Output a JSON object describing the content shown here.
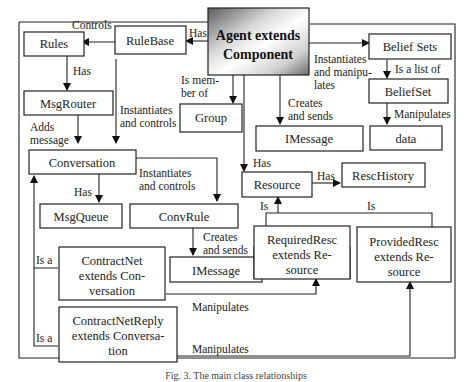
{
  "diagram": {
    "nodes": {
      "agent": {
        "line1": "Agent extends",
        "line2": "Component"
      },
      "rulebase": "RuleBase",
      "rules": "Rules",
      "msgrouter": "MsgRouter",
      "group": "Group",
      "beliefsets": "Belief  Sets",
      "beliefset": "BeliefSet",
      "data": "data",
      "imessage1": "IMessage",
      "conversation": "Conversation",
      "msgqueue": "MsgQueue",
      "convrule": "ConvRule",
      "imessage2": "IMessage",
      "resource": "Resource",
      "reschistory": "RescHistory",
      "requiredresc": {
        "line1": "RequiredResc",
        "line2": "extends Re-",
        "line3": "source"
      },
      "providedresc": {
        "line1": "ProvidedResc",
        "line2": "extends Re-",
        "line3": "source"
      },
      "contractnet": {
        "line1": "ContractNet",
        "line2": "extends Con-",
        "line3": "versation"
      },
      "contractnetreply": {
        "line1": "ContractNetReply",
        "line2": "extends Conversa-",
        "line3": "tion"
      }
    },
    "edges": {
      "agent_rulebase": "Has",
      "rulebase_rules": "Controls",
      "rules_msgrouter": "Has",
      "agent_group": {
        "line1": "Is   mem-",
        "line2": "ber of"
      },
      "rulebase_conversation": {
        "line1": "Instantiates",
        "line2": "and controls"
      },
      "msgrouter_conversation": {
        "line1": "Adds",
        "line2": "message"
      },
      "agent_beliefsets": {
        "line1": "Instantiates",
        "line2": "and  manipu-",
        "line3": "lates"
      },
      "beliefsets_beliefset": "Is a list of",
      "beliefset_data": "Manipulates",
      "agent_imessage": {
        "line1": "Creates",
        "line2": "and sends"
      },
      "conversation_msgqueue": "Has",
      "conversation_convrule": {
        "line1": "Instantiates",
        "line2": "and controls"
      },
      "convrule_imessage": {
        "line1": "Creates",
        "line2": "and sends"
      },
      "agent_resource": "Has",
      "resource_reschistory": "Has",
      "requiredresc_resource": "Is",
      "providedresc_resource": "Is",
      "contractnet_conversation": "Is a",
      "contractnetreply_conversation": "Is a",
      "contractnet_requiredresc": "Manipulates",
      "contractnetreply_providedresc": "Manipulates"
    },
    "caption": "Fig. 3. The main class relationships"
  }
}
